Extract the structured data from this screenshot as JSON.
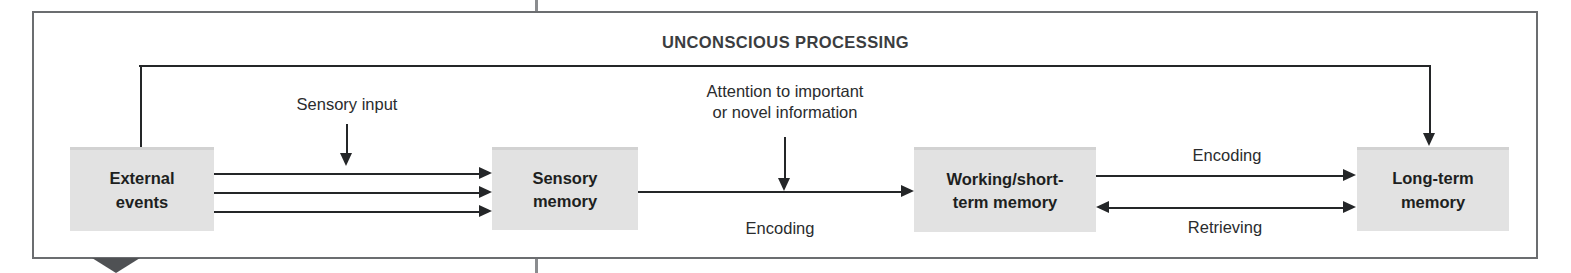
{
  "figure": {
    "title": "UNCONSCIOUS PROCESSING",
    "colors": {
      "frame": "#6b6d70",
      "box_fill": "#e2e2e2",
      "box_text": "#1d1f21",
      "arrow": "#242628",
      "label_text": "#2a2c2e",
      "notch": "#4f5154",
      "background": "#ffffff"
    }
  },
  "nodes": [
    {
      "id": "external",
      "label": "External\nevents"
    },
    {
      "id": "sensory",
      "label": "Sensory\nmemory"
    },
    {
      "id": "working",
      "label": "Working/short-\nterm memory"
    },
    {
      "id": "longterm",
      "label": "Long-term\nmemory"
    }
  ],
  "edge_labels": {
    "sensory_input": "Sensory input",
    "attention": "Attention to important\nor novel information",
    "encoding_left": "Encoding",
    "encoding_right": "Encoding",
    "retrieving": "Retrieving"
  },
  "edges": [
    {
      "from": "external",
      "to": "sensory",
      "style": "triple-arrow",
      "label": "Sensory input"
    },
    {
      "from": "sensory",
      "to": "working",
      "style": "arrow",
      "label": "Encoding"
    },
    {
      "from": "attention-note",
      "to": "sensory-working-path",
      "style": "arrow-down",
      "label": "Attention to important or novel information"
    },
    {
      "from": "working",
      "to": "longterm",
      "style": "arrow",
      "label": "Encoding"
    },
    {
      "from": "longterm",
      "to": "working",
      "style": "double-arrow",
      "label": "Retrieving"
    },
    {
      "from": "external",
      "to": "longterm",
      "style": "feedback-loop",
      "label": ""
    }
  ]
}
